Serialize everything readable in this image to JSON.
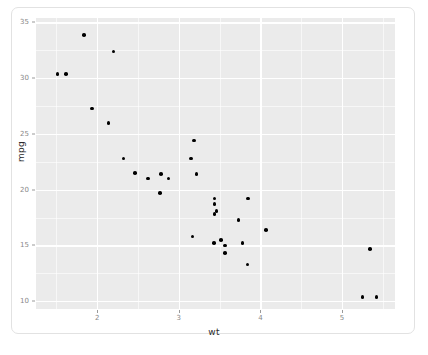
{
  "chart_data": {
    "type": "scatter",
    "title": "",
    "xlabel": "wt",
    "ylabel": "mpg",
    "xlim": [
      1.25,
      5.65
    ],
    "ylim": [
      9.3,
      35.4
    ],
    "xticks": [
      2,
      3,
      4,
      5
    ],
    "xtick_labels": [
      "2",
      "3",
      "4",
      "5"
    ],
    "yticks": [
      10,
      15,
      20,
      25,
      30,
      35
    ],
    "ytick_labels": [
      "10",
      "15",
      "20",
      "25",
      "30",
      "35"
    ],
    "x_minor_ticks": [
      1.5,
      2.5,
      3.5,
      4.5,
      5.5
    ],
    "y_minor_ticks": [
      12.5,
      17.5,
      22.5,
      27.5,
      32.5
    ],
    "grid": true,
    "legend": "none",
    "panel_background": "#ebebeb",
    "grid_color": "#ffffff",
    "point_color": "#000000",
    "point_size": 3.6,
    "x": [
      2.62,
      2.875,
      2.32,
      3.215,
      3.44,
      3.46,
      3.57,
      3.19,
      3.15,
      3.44,
      3.44,
      4.07,
      3.73,
      3.78,
      5.25,
      5.424,
      5.345,
      2.2,
      1.615,
      1.835,
      2.465,
      3.52,
      3.435,
      3.84,
      3.845,
      1.935,
      2.14,
      1.513,
      3.17,
      2.77,
      3.57,
      2.78
    ],
    "y": [
      21.0,
      21.0,
      22.8,
      21.4,
      18.7,
      18.1,
      14.3,
      24.4,
      22.8,
      19.2,
      17.8,
      16.4,
      17.3,
      15.2,
      10.4,
      10.4,
      14.7,
      32.4,
      30.4,
      33.9,
      21.5,
      15.5,
      15.2,
      13.3,
      19.2,
      27.3,
      26.0,
      30.4,
      15.8,
      19.7,
      15.0,
      21.4
    ]
  },
  "axes": {
    "y_title": "mpg",
    "x_title": "wt"
  },
  "caption": {
    "artifact_text": ""
  }
}
